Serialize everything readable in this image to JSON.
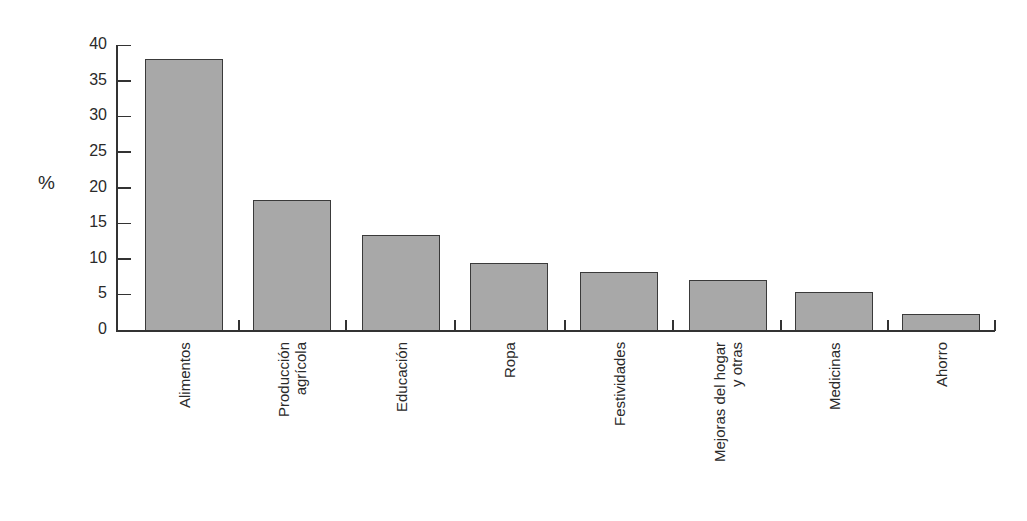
{
  "chart_data": {
    "type": "bar",
    "title": "",
    "xlabel": "",
    "ylabel": "%",
    "ylim": [
      0,
      40
    ],
    "yticks": [
      0,
      5,
      10,
      15,
      20,
      25,
      30,
      35,
      40
    ],
    "grid": false,
    "legend": null,
    "categories": [
      "Alimentos",
      "Producción agrícola",
      "Educación",
      "Ropa",
      "Festividades",
      "Mejoras del hogar y otras",
      "Medicinas",
      "Ahorro"
    ],
    "category_label_lines": [
      [
        "Alimentos"
      ],
      [
        "Producción",
        "agrícola"
      ],
      [
        "Educación"
      ],
      [
        "Ropa"
      ],
      [
        "Festividades"
      ],
      [
        "Mejoras del hogar",
        "y otras"
      ],
      [
        "Medicinas"
      ],
      [
        "Ahorro"
      ]
    ],
    "values": [
      38,
      18.3,
      13.4,
      9.4,
      8.2,
      7.0,
      5.4,
      2.3
    ],
    "bar_color": "#a8a8a8",
    "bar_edge_color": "#3a3a3a"
  }
}
